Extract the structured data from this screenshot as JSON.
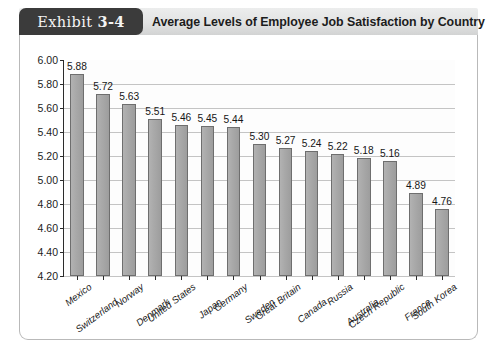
{
  "header": {
    "exhibit_prefix": "Exhibit",
    "exhibit_number": "3-4",
    "title": "Average Levels of Employee Job Satisfaction by Country"
  },
  "colors": {
    "tab_background": "#3b3b3b",
    "tab_text": "#f4f4f4",
    "header_background": "#e2e3e3",
    "bar_fill": "#a9a9a9",
    "bar_border": "#6e6e6e",
    "gridline": "#c4c4c4",
    "axis": "#2b2b2b",
    "frame_border": "#b9b9b9",
    "plot_background": "#fdfdfd"
  },
  "chart_data": {
    "type": "bar",
    "title": "Average Levels of Employee Job Satisfaction by Country",
    "xlabel": "",
    "ylabel": "",
    "ylim": [
      4.2,
      6.0
    ],
    "ytick_step": 0.2,
    "ytick_labels": [
      "6.00",
      "5.80",
      "5.60",
      "5.40",
      "5.20",
      "5.00",
      "4.80",
      "4.60",
      "4.40",
      "4.20"
    ],
    "grid": true,
    "legend": null,
    "categories": [
      "Mexico",
      "Switzerland",
      "Norway",
      "Denmark",
      "United States",
      "Japan",
      "Germany",
      "Sweden",
      "Great Britain",
      "Canada",
      "Russia",
      "Australia",
      "Czech Republic",
      "France",
      "South Korea"
    ],
    "values": [
      5.88,
      5.72,
      5.63,
      5.51,
      5.46,
      5.45,
      5.44,
      5.3,
      5.27,
      5.24,
      5.22,
      5.18,
      5.16,
      4.89,
      4.76
    ],
    "value_labels": [
      "5.88",
      "5.72",
      "5.63",
      "5.51",
      "5.46",
      "5.45",
      "5.44",
      "5.30",
      "5.27",
      "5.24",
      "5.22",
      "5.18",
      "5.16",
      "4.89",
      "4.76"
    ]
  }
}
